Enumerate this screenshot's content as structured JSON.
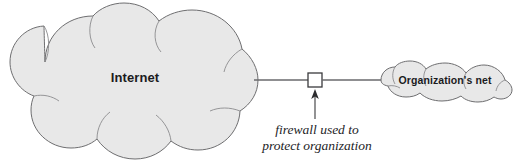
{
  "diagram": {
    "title": "firewall used to protect organization",
    "type": "network-diagram",
    "background_color": "#ffffff",
    "nodes": [
      {
        "id": "internet-cloud",
        "kind": "cloud",
        "label": "Internet",
        "fill_color": "#e8e8e8",
        "stroke_color": "#6e6e70"
      },
      {
        "id": "firewall-box",
        "kind": "square",
        "label": "",
        "fill_color": "#ffffff",
        "stroke_color": "#3a3a3c"
      },
      {
        "id": "organization-net-cloud",
        "kind": "cloud",
        "label": "Organization's net",
        "fill_color": "#e8e8e8",
        "stroke_color": "#6e6e70"
      }
    ],
    "links": [
      {
        "id": "link-internet-firewall",
        "from": "internet-cloud",
        "to": "firewall-box",
        "color": "#6a6a6c"
      },
      {
        "id": "link-firewall-orgnet",
        "from": "firewall-box",
        "to": "organization-net-cloud",
        "color": "#6a6a6c"
      }
    ],
    "annotation": {
      "target": "firewall-box",
      "line_1": "firewall used to",
      "line_2": "protect organization",
      "arrow_color": "#2c2c2e"
    }
  }
}
